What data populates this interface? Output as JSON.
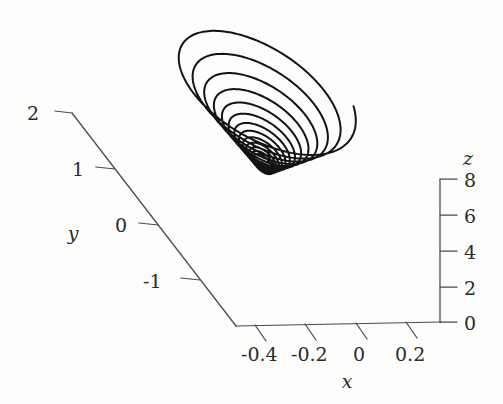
{
  "figure": {
    "background_color": "#fdfdfc",
    "curve_color": "#131313",
    "axis_color": "#4a4a4a",
    "label_color": "#2b2b2b"
  },
  "axes": {
    "x": {
      "name": "x",
      "ticks": [
        "-0.4",
        "-0.2",
        "0",
        "0.2"
      ],
      "tick_values": [
        -0.4,
        -0.2,
        0,
        0.2
      ],
      "range": [
        -0.5,
        0.3
      ]
    },
    "y": {
      "name": "y",
      "ticks": [
        "2",
        "1",
        "0",
        "-1"
      ],
      "tick_values": [
        2,
        1,
        0,
        -1
      ],
      "range": [
        -1.6,
        2.3
      ]
    },
    "z": {
      "name": "z",
      "ticks": [
        "0",
        "2",
        "4",
        "6",
        "8"
      ],
      "tick_values": [
        0,
        2,
        4,
        6,
        8
      ],
      "range": [
        0,
        8.6
      ]
    }
  },
  "chart_data": {
    "type": "line",
    "title": "",
    "xlabel": "x",
    "ylabel": "y",
    "zlabel": "z",
    "xlim": [
      -0.5,
      0.3
    ],
    "ylim": [
      -1.6,
      2.3
    ],
    "zlim": [
      0,
      8.6
    ],
    "grid": false,
    "legend": "none",
    "projection": "3d",
    "series": [
      {
        "name": "trajectory",
        "color": "#131313",
        "turns": 13,
        "start_point": {
          "x": 0.02,
          "y": 0.1,
          "z": 3.4
        },
        "end_point": {
          "x": -0.3,
          "y": 1.9,
          "z": 8.4
        },
        "amplitude_growth": "exponential, from ~0.03 to ~0.45 in x over 13 turns"
      }
    ]
  }
}
